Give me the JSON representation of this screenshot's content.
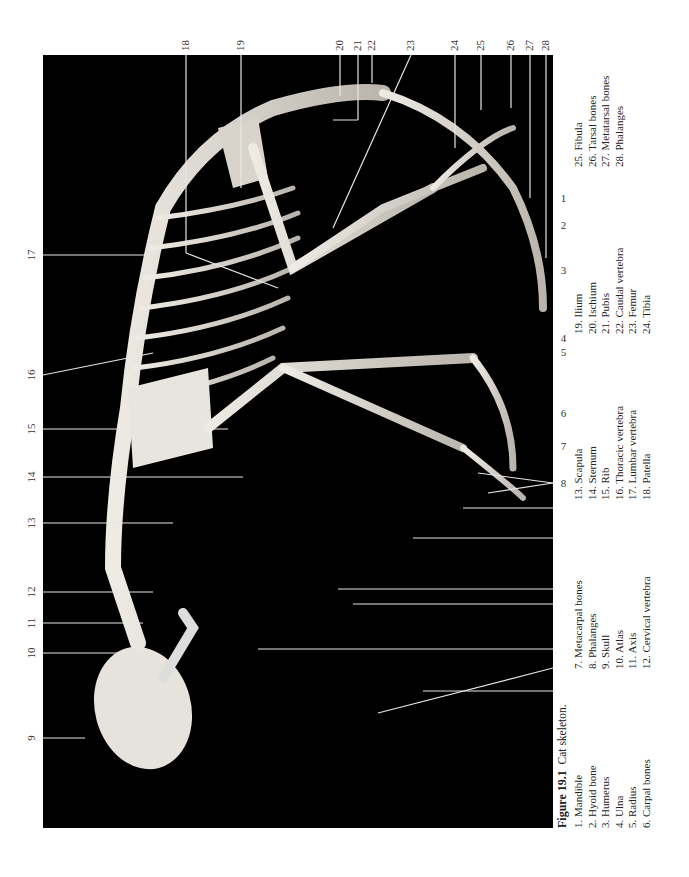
{
  "figure": {
    "number_label": "Figure 19.1",
    "title": "Cat skeleton."
  },
  "colors": {
    "photo_background": "#000000",
    "bone": "#d9d6cf",
    "leader_line": "#e8e8e8",
    "text": "#222222"
  },
  "callouts": {
    "bottom": [
      "1",
      "2",
      "3",
      "4",
      "5",
      "6",
      "7",
      "8"
    ],
    "left": [
      "9",
      "10",
      "11",
      "12",
      "13",
      "14",
      "15",
      "16",
      "17"
    ],
    "top": [
      "18",
      "19",
      "20",
      "21",
      "22",
      "23",
      "24",
      "25",
      "26",
      "27",
      "28"
    ]
  },
  "legend": {
    "col1": [
      "1. Mandible",
      "2. Hyoid bone",
      "3. Humerus",
      "4. Ulna",
      "5. Radius",
      "6. Carpal bones"
    ],
    "col2": [
      "7. Metacarpal bones",
      "8. Phalanges",
      "9. Skull",
      "10. Atlas",
      "11. Axis",
      "12. Cervical vertebra"
    ],
    "col3": [
      "13. Scapula",
      "14. Sternum",
      "15. Rib",
      "16. Thoracic vertebra",
      "17. Lumbar vertebra",
      "18. Patella"
    ],
    "col4": [
      "19. Ilium",
      "20. Ischium",
      "21. Pubis",
      "22. Caudal vertebra",
      "23. Femur",
      "24. Tibia"
    ],
    "col5": [
      "25. Fibula",
      "26. Tarsal bones",
      "27. Metatarsal bones",
      "28. Phalanges"
    ]
  }
}
